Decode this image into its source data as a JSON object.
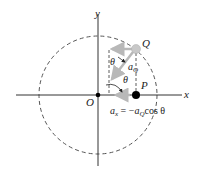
{
  "diagram": {
    "axes": {
      "x_label": "x",
      "y_label": "y"
    },
    "points": {
      "origin": "O",
      "Q": "Q",
      "P": "P"
    },
    "angles": {
      "theta_top": "θ",
      "theta_bottom": "θ"
    },
    "vectors": {
      "aQ_label": "a",
      "aQ_sub": "Q"
    },
    "equation": {
      "lhs": "a",
      "lhs_sub": "x",
      "eq": " = −",
      "a": "a",
      "a_sub": "Q",
      "rhs": "cos θ"
    },
    "colors": {
      "axis": "#333333",
      "circle": "#555555",
      "vector": "#b8b8b8",
      "point_q": "#c8c8c8",
      "point_p": "#000000"
    }
  }
}
